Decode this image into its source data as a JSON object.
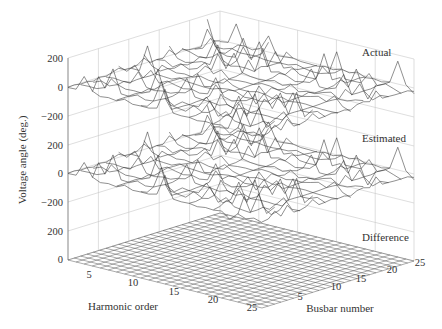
{
  "chart_data": {
    "type": "surface3d",
    "title": "",
    "xlabel": "Harmonic order",
    "ylabel": "Busbar number",
    "zlabel": "Voltage angle (deg.)",
    "x_ticks": [
      "5",
      "10",
      "15",
      "20",
      "25"
    ],
    "y_ticks": [
      "5",
      "10",
      "15",
      "20",
      "25"
    ],
    "xlim": [
      1,
      25
    ],
    "ylim": [
      1,
      25
    ],
    "panels": [
      {
        "name": "Actual",
        "z_ticks": [
          "200",
          "0",
          "-200"
        ],
        "zlim": [
          -200,
          200
        ],
        "description": "Jagged surface of voltage angles oscillating roughly between -180 and 180 degrees"
      },
      {
        "name": "Estimated",
        "z_ticks": [
          "200",
          "0",
          "-200"
        ],
        "zlim": [
          -200,
          200
        ],
        "description": "Nearly identical to Actual surface"
      },
      {
        "name": "Difference",
        "z_ticks": [
          "200",
          "0"
        ],
        "zlim": [
          0,
          200
        ],
        "description": "Flat mesh at approximately 0 degrees"
      }
    ],
    "grid": true
  },
  "labels": {
    "z_axis": "Voltage angle (deg.)",
    "x_axis": "Harmonic order",
    "y_axis": "Busbar number",
    "panel_actual": "Actual",
    "panel_estimated": "Estimated",
    "panel_difference": "Difference",
    "zt": [
      "200",
      "0",
      "−200",
      "200",
      "0",
      "−200",
      "200",
      "0"
    ],
    "xt": [
      "5",
      "10",
      "15",
      "20",
      "25"
    ],
    "yt": [
      "5",
      "10",
      "15",
      "20",
      "25"
    ]
  }
}
